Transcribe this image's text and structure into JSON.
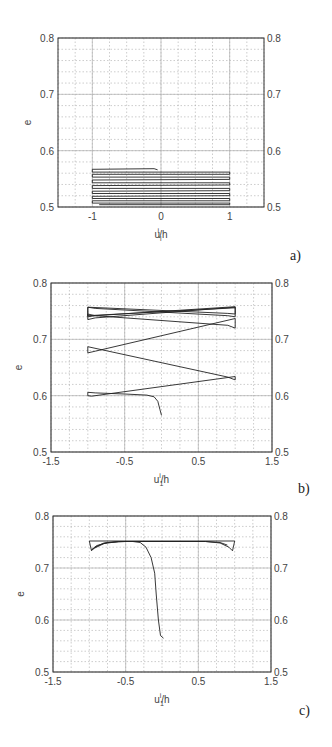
{
  "figure": {
    "panel_labels": [
      "a)",
      "b)",
      "c)"
    ]
  },
  "chart_data": [
    {
      "type": "line",
      "id": "a",
      "panel_label": "a)",
      "xlabel": "u_i^i/h",
      "ylabel": "e",
      "xlim": [
        -1.5,
        1.5
      ],
      "ylim": [
        0.5,
        0.8
      ],
      "xticks": [
        -1,
        0,
        1
      ],
      "xtick_labels": [
        "-1",
        "0",
        "1"
      ],
      "yticks": [
        0.5,
        0.6,
        0.7,
        0.8
      ],
      "ytick_labels": [
        "0.5",
        "0.6",
        "0.7",
        "0.8"
      ],
      "right_yticks": true,
      "grid": {
        "major": true,
        "minor": true,
        "x_minor_step": 0.25,
        "y_minor_step": 0.02
      },
      "legend": null,
      "series": [
        {
          "name": "cyclic response",
          "points": [
            [
              -0.05,
              0.566
            ],
            [
              -0.1,
              0.568
            ],
            [
              -1,
              0.567
            ],
            [
              -1,
              0.562
            ],
            [
              1,
              0.562
            ],
            [
              1,
              0.558
            ],
            [
              -1,
              0.558
            ],
            [
              -1,
              0.553
            ],
            [
              1,
              0.553
            ],
            [
              1,
              0.549
            ],
            [
              -1,
              0.548
            ],
            [
              -1,
              0.543
            ],
            [
              1,
              0.543
            ],
            [
              1,
              0.539
            ],
            [
              -1,
              0.538
            ],
            [
              -1,
              0.533
            ],
            [
              1,
              0.533
            ],
            [
              1,
              0.529
            ],
            [
              -1,
              0.528
            ],
            [
              -1,
              0.524
            ],
            [
              1,
              0.524
            ],
            [
              1,
              0.52
            ],
            [
              -1,
              0.519
            ],
            [
              -1,
              0.515
            ],
            [
              1,
              0.515
            ],
            [
              1,
              0.511
            ],
            [
              -1,
              0.511
            ],
            [
              -1,
              0.507
            ],
            [
              1,
              0.507
            ],
            [
              1,
              0.504
            ],
            [
              -0.9,
              0.504
            ]
          ]
        }
      ]
    },
    {
      "type": "line",
      "id": "b",
      "panel_label": "b)",
      "xlabel": "u_1^i/h",
      "ylabel": "e",
      "xlim": [
        -1.5,
        1.5
      ],
      "ylim": [
        0.5,
        0.8
      ],
      "xticks": [
        -1.5,
        -0.5,
        0.5,
        1.5
      ],
      "xtick_labels": [
        "-1.5",
        "-0.5",
        "0.5",
        "1.5"
      ],
      "yticks": [
        0.5,
        0.6,
        0.7,
        0.8
      ],
      "ytick_labels": [
        "0.5",
        "0.6",
        "0.7",
        "0.8"
      ],
      "right_yticks": true,
      "grid": {
        "major": true,
        "minor": true,
        "x_minor_step": 0.25,
        "y_minor_step": 0.02
      },
      "legend": null,
      "series": [
        {
          "name": "cyclic response",
          "points": [
            [
              0.0,
              0.565
            ],
            [
              -0.02,
              0.575
            ],
            [
              -0.05,
              0.59
            ],
            [
              -0.1,
              0.598
            ],
            [
              -0.2,
              0.601
            ],
            [
              -0.5,
              0.603
            ],
            [
              -0.9,
              0.605
            ],
            [
              -1.0,
              0.606
            ],
            [
              -1.0,
              0.6
            ],
            [
              -0.95,
              0.599
            ],
            [
              1.0,
              0.634
            ],
            [
              1.0,
              0.628
            ],
            [
              0.9,
              0.633
            ],
            [
              -1.0,
              0.687
            ],
            [
              -1.0,
              0.676
            ],
            [
              -0.9,
              0.679
            ],
            [
              1.0,
              0.737
            ],
            [
              1.0,
              0.72
            ],
            [
              0.9,
              0.725
            ],
            [
              -0.9,
              0.742
            ],
            [
              -1.0,
              0.745
            ],
            [
              -1.0,
              0.735
            ],
            [
              -0.9,
              0.738
            ],
            [
              1.0,
              0.757
            ],
            [
              1.0,
              0.74
            ],
            [
              0.9,
              0.742
            ],
            [
              -0.9,
              0.755
            ],
            [
              -1.0,
              0.757
            ],
            [
              -1.0,
              0.74
            ],
            [
              -0.9,
              0.742
            ],
            [
              1.0,
              0.758
            ],
            [
              1.0,
              0.745
            ],
            [
              0.9,
              0.746
            ],
            [
              -1.0,
              0.757
            ],
            [
              -1.0,
              0.742
            ],
            [
              1.0,
              0.756
            ]
          ]
        }
      ]
    },
    {
      "type": "line",
      "id": "c",
      "panel_label": "c)",
      "xlabel": "u_1^i/h",
      "ylabel": "e",
      "xlim": [
        -1.5,
        1.5
      ],
      "ylim": [
        0.5,
        0.8
      ],
      "xticks": [
        -1.5,
        -0.5,
        0.5,
        1.5
      ],
      "xtick_labels": [
        "-1.5",
        "-0.5",
        "0.5",
        "1.5"
      ],
      "yticks": [
        0.5,
        0.6,
        0.7,
        0.8
      ],
      "ytick_labels": [
        "0.5",
        "0.6",
        "0.7",
        "0.8"
      ],
      "right_yticks": true,
      "grid": {
        "major": true,
        "minor": true,
        "x_minor_step": 0.25,
        "y_minor_step": 0.02
      },
      "legend": null,
      "series": [
        {
          "name": "cyclic response",
          "points": [
            [
              0.02,
              0.565
            ],
            [
              -0.02,
              0.57
            ],
            [
              -0.05,
              0.6
            ],
            [
              -0.08,
              0.65
            ],
            [
              -0.1,
              0.69
            ],
            [
              -0.15,
              0.72
            ],
            [
              -0.22,
              0.74
            ],
            [
              -0.3,
              0.749
            ],
            [
              -0.4,
              0.751
            ],
            [
              -0.6,
              0.751
            ],
            [
              -0.8,
              0.748
            ],
            [
              -0.92,
              0.74
            ],
            [
              -0.97,
              0.733
            ],
            [
              -1.0,
              0.752
            ],
            [
              1.0,
              0.752
            ],
            [
              0.97,
              0.733
            ],
            [
              0.92,
              0.74
            ],
            [
              0.8,
              0.748
            ],
            [
              0.6,
              0.751
            ],
            [
              -0.6,
              0.751
            ],
            [
              -0.8,
              0.747
            ],
            [
              -0.93,
              0.738
            ],
            [
              -0.97,
              0.735
            ],
            [
              -0.9,
              0.743
            ],
            [
              -0.75,
              0.749
            ],
            [
              -0.5,
              0.751
            ],
            [
              0.6,
              0.751
            ],
            [
              0.8,
              0.749
            ],
            [
              0.9,
              0.744
            ]
          ]
        }
      ]
    }
  ]
}
